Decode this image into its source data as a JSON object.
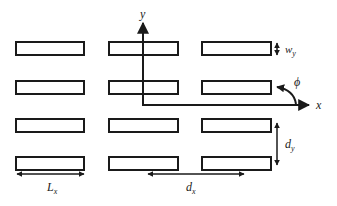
{
  "diagram": {
    "colors": {
      "stroke": "#1a1a1a",
      "background": "#ffffff",
      "label": "#222222"
    },
    "axes": {
      "x_label": "x",
      "y_label": "y",
      "angle_label": "ϕ"
    },
    "dimensions": {
      "width_label_main": "w",
      "width_label_sub": "y",
      "length_label_main": "L",
      "length_label_sub": "x",
      "period_x_main": "d",
      "period_x_sub": "x",
      "period_y_main": "d",
      "period_y_sub": "y"
    },
    "grid": {
      "rows": 4,
      "columns": 3
    }
  }
}
